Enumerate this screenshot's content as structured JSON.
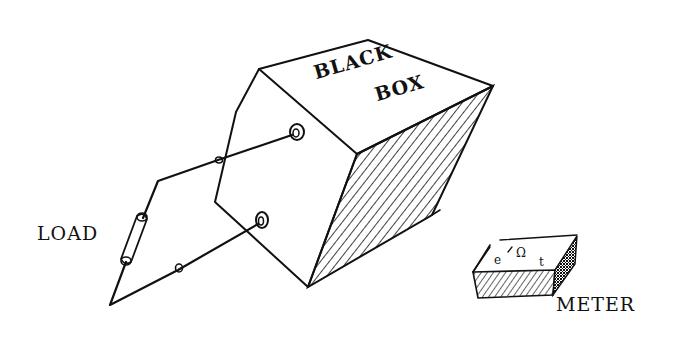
{
  "diagram": {
    "type": "hand-drawn sketch",
    "ink_color": "#111111",
    "background_color": "#ffffff",
    "black_box": {
      "label_line1": "BLACK",
      "label_line2": "BOX",
      "terminals": 2,
      "shaded_side": "right"
    },
    "load": {
      "label": "LOAD"
    },
    "meter": {
      "label": "METER",
      "face_symbols": [
        "e",
        "Ω",
        "t"
      ]
    },
    "connections": [
      {
        "from": "black_box.terminal_upper",
        "to": "load.top"
      },
      {
        "from": "load.bottom",
        "to": "black_box.terminal_lower"
      }
    ]
  }
}
